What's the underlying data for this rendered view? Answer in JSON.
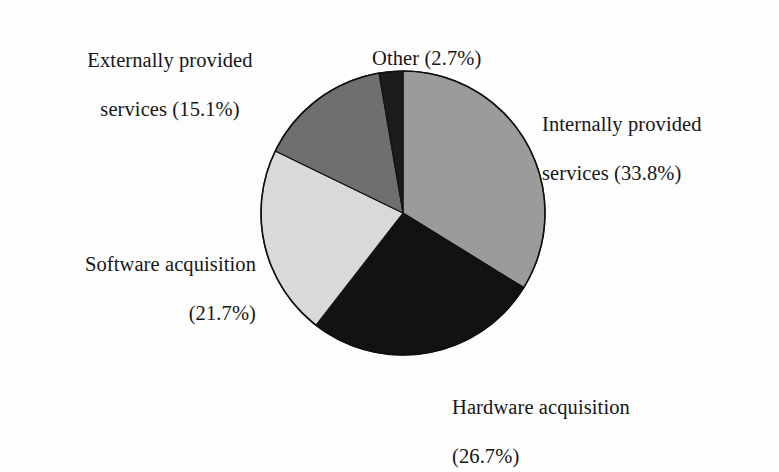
{
  "chart_data": {
    "type": "pie",
    "title": "",
    "subtitle": "",
    "xlabel": "",
    "ylabel": "",
    "legend_position": "none",
    "grid": false,
    "units": "percent",
    "start_angle_deg": 0,
    "direction": "clockwise",
    "categories": [
      "Internally provided services",
      "Hardware acquisition",
      "Software acquisition",
      "Externally provided services",
      "Other"
    ],
    "values": [
      33.8,
      26.7,
      21.7,
      15.1,
      2.7
    ],
    "colors": [
      "#9b9b9b",
      "#121212",
      "#d9d9d9",
      "#6f6f6f",
      "#1c1c1c"
    ],
    "slices": [
      {
        "name": "Internally provided services",
        "value": 33.8,
        "value_text": "33.8%",
        "label_lines": [
          "Internally provided",
          "services (33.8%)"
        ],
        "color": "#9b9b9b",
        "start_deg": 0,
        "end_deg": 121.68
      },
      {
        "name": "Hardware acquisition",
        "value": 26.7,
        "value_text": "26.7%",
        "label_lines": [
          "Hardware acquisition",
          "(26.7%)"
        ],
        "color": "#121212",
        "start_deg": 121.68,
        "end_deg": 217.8
      },
      {
        "name": "Software acquisition",
        "value": 21.7,
        "value_text": "21.7%",
        "label_lines": [
          "Software acquisition",
          "(21.7%)"
        ],
        "color": "#d9d9d9",
        "start_deg": 217.8,
        "end_deg": 295.92
      },
      {
        "name": "Externally provided services",
        "value": 15.1,
        "value_text": "15.1%",
        "label_lines": [
          "Externally provided",
          "services (15.1%)"
        ],
        "color": "#6f6f6f",
        "start_deg": 295.92,
        "end_deg": 350.28
      },
      {
        "name": "Other",
        "value": 2.7,
        "value_text": "2.7%",
        "label_lines": [
          "Other (2.7%)"
        ],
        "color": "#1c1c1c",
        "start_deg": 350.28,
        "end_deg": 360
      }
    ]
  },
  "labels": {
    "externally": {
      "line1": "Externally provided",
      "line2": "services (15.1%)"
    },
    "other": {
      "line1": "Other (2.7%)"
    },
    "internally": {
      "line1": "Internally provided",
      "line2": "services (33.8%)"
    },
    "software": {
      "line1": "Software acquisition",
      "line2": "(21.7%)"
    },
    "hardware": {
      "line1": "Hardware acquisition",
      "line2": "(26.7%)"
    }
  },
  "style": {
    "background": "#fdfdfd",
    "text_color": "#161616",
    "outline_color": "#101010"
  }
}
